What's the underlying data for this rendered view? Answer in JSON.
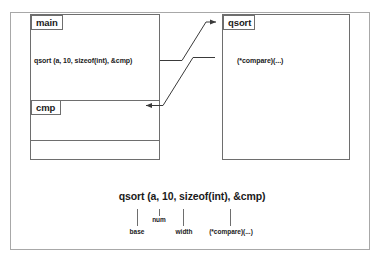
{
  "diagram": {
    "title_absent": true,
    "boxes": [
      {
        "id": "main",
        "label": "main",
        "body_text": "qsort (a, 10, sizeof(int), &cmp)"
      },
      {
        "id": "qsort",
        "label": "qsort",
        "body_text": "(*compare)(...)"
      },
      {
        "id": "cmp",
        "label": "cmp",
        "body_text": ""
      }
    ],
    "arrows": [
      {
        "from": "main-call",
        "to": "qsort-box",
        "direction": "right-up"
      },
      {
        "from": "qsort-box",
        "to": "cmp-box",
        "direction": "left-down"
      }
    ]
  },
  "legend": {
    "signature": "qsort (a, 10, sizeof(int), &cmp)",
    "params": [
      {
        "name": "base",
        "arg": "a"
      },
      {
        "name": "num",
        "arg": "10"
      },
      {
        "name": "width",
        "arg": "sizeof(int)"
      },
      {
        "name": "(*compare)(...)",
        "arg": "&cmp"
      }
    ]
  },
  "colors": {
    "frame_border": "#a8a8a8",
    "box_border": "#6e6e6e",
    "text": "#1a1a1a",
    "background": "#ffffff"
  }
}
